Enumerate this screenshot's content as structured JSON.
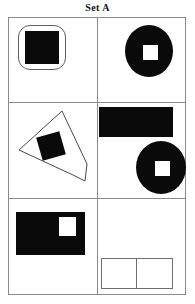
{
  "puzzle": {
    "title": "Set A",
    "type": "visual-matrix-reasoning",
    "grid": {
      "rows": 3,
      "columns": 2
    },
    "colors": {
      "figure_fill": "#0a0a0a",
      "figure_hole": "#ffffff",
      "outline": "#5e5e5e",
      "grid_line": "#8a8a8a",
      "background": "#ffffff",
      "title_text": "#111111"
    },
    "cells": [
      {
        "position": "row1-col1",
        "name": "cell-1",
        "description": "Black square inside rounded-square outline",
        "shapes": [
          "rounded-square-outline",
          "black-square"
        ]
      },
      {
        "position": "row1-col2",
        "name": "cell-2",
        "description": "Black circle with white square hole in center",
        "shapes": [
          "black-circle",
          "white-square-hole"
        ]
      },
      {
        "position": "row2-col1",
        "name": "cell-3",
        "description": "Tilted elongated pentagon outline with rotated black square",
        "shapes": [
          "pentagon-outline",
          "rotated-black-square"
        ]
      },
      {
        "position": "row2-col2",
        "name": "cell-4",
        "description": "Black rectangle above black circle with white square hole",
        "shapes": [
          "black-rectangle",
          "black-circle",
          "white-square-hole"
        ]
      },
      {
        "position": "row3-col1",
        "name": "cell-5",
        "description": "Black rectangle with white square in upper right",
        "shapes": [
          "black-rectangle",
          "white-square-hole"
        ]
      },
      {
        "position": "row3-col2",
        "name": "cell-6",
        "description": "Empty answer box divided into two halves",
        "shapes": [
          "empty-answer-box"
        ]
      }
    ]
  }
}
